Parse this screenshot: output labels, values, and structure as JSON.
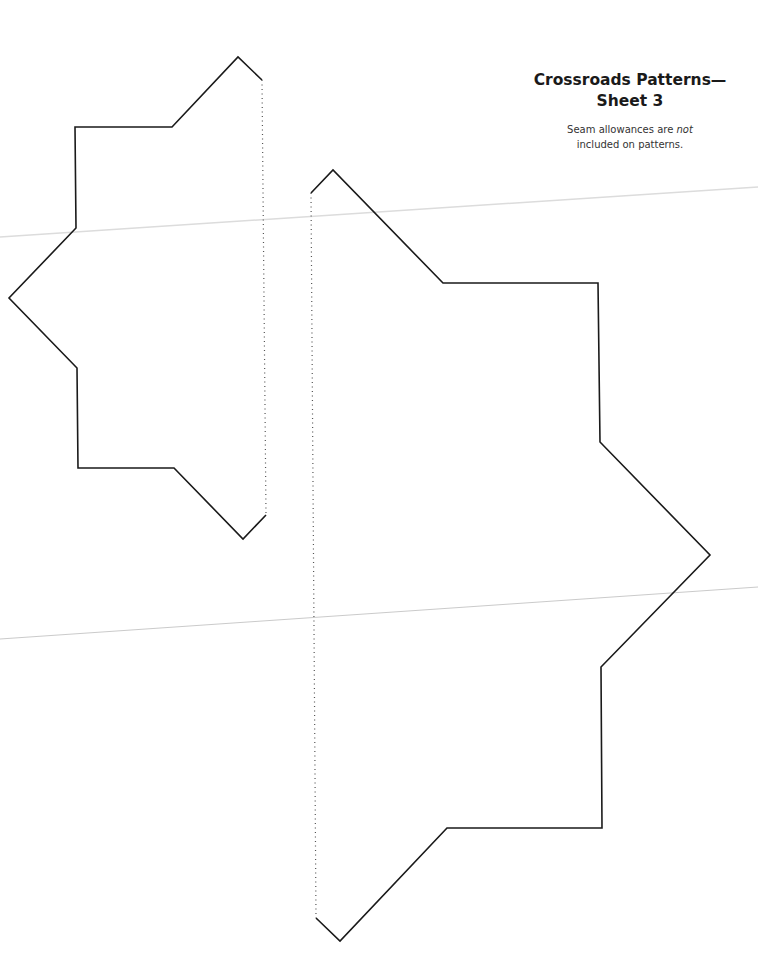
{
  "page": {
    "title_line1": "Crossroads Patterns—",
    "title_line2": "Sheet 3",
    "note_prefix": "Seam allowances are ",
    "note_emphasis": "not",
    "note_line2": "included on patterns."
  },
  "colors": {
    "outline": "#1a1a1a",
    "fold_line": "#555555",
    "scan_artifact": "#d0d0d0"
  },
  "patterns": [
    {
      "name": "left-half-star-template",
      "solid_points": "262,80 238,57 172,127 75,127 76,228 9,298 77,368 78,468 174,468 243,539 266,515",
      "fold_line": {
        "x1": 262,
        "y1": 80,
        "x2": 266,
        "y2": 515
      }
    },
    {
      "name": "right-half-star-template",
      "solid_points": "311,193 333,170 443,283 598,283 600,442 710,555 601,667 602,828 447,828 340,941 316,918",
      "fold_line": {
        "x1": 311,
        "y1": 193,
        "x2": 316,
        "y2": 918
      }
    }
  ]
}
